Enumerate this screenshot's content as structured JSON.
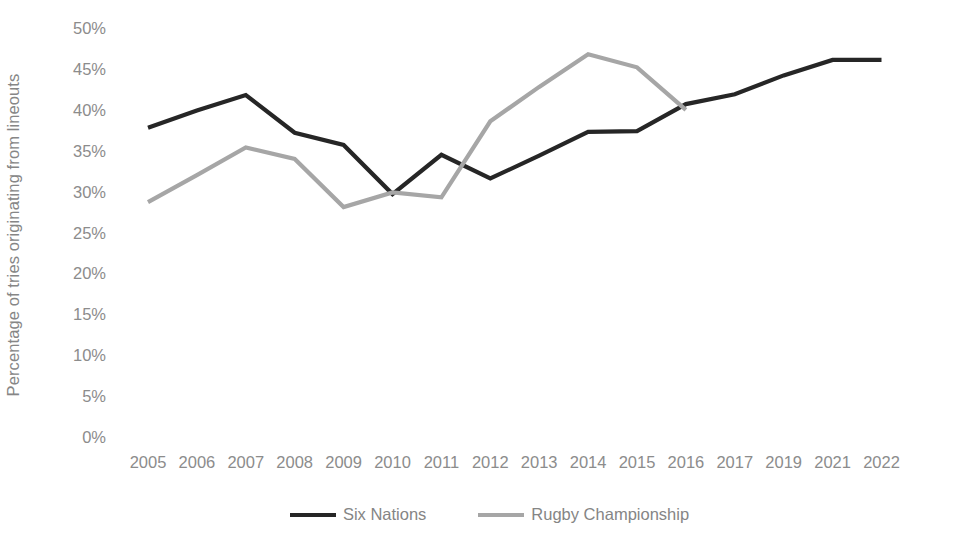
{
  "chart_data": {
    "type": "line",
    "title": "",
    "xlabel": "",
    "ylabel": "Percentage of tries originating from lineouts",
    "x": [
      "2005",
      "2006",
      "2007",
      "2008",
      "2009",
      "2010",
      "2011",
      "2012",
      "2013",
      "2014",
      "2015",
      "2016",
      "2017",
      "2019",
      "2021",
      "2022"
    ],
    "categories": [
      "2005",
      "2006",
      "2007",
      "2008",
      "2009",
      "2010",
      "2011",
      "2012",
      "2013",
      "2014",
      "2015",
      "2016",
      "2017",
      "2019",
      "2021",
      "2022"
    ],
    "ylim": [
      0,
      50
    ],
    "ytick_labels": [
      "0%",
      "5%",
      "10%",
      "15%",
      "20%",
      "25%",
      "30%",
      "35%",
      "40%",
      "45%",
      "50%"
    ],
    "ytick_values": [
      0,
      5,
      10,
      15,
      20,
      25,
      30,
      35,
      40,
      45,
      50
    ],
    "grid": false,
    "legend_position": "bottom",
    "series": [
      {
        "name": "Six Nations",
        "color": "#262626",
        "values": [
          37.8,
          39.9,
          41.8,
          37.2,
          35.7,
          29.7,
          34.5,
          31.6,
          34.4,
          37.3,
          37.4,
          40.7,
          41.9,
          44.2,
          46.1,
          46.1
        ]
      },
      {
        "name": "Rugby Championship",
        "color": "#a6a6a6",
        "values": [
          28.7,
          32.0,
          35.4,
          34.0,
          28.1,
          29.9,
          29.3,
          38.6,
          42.8,
          46.8,
          45.2,
          40.0,
          null,
          null,
          null,
          null
        ]
      }
    ]
  },
  "legend": {
    "items": [
      {
        "label": "Six Nations",
        "color": "#262626"
      },
      {
        "label": "Rugby Championship",
        "color": "#a6a6a6"
      }
    ]
  },
  "axes": {
    "y_title": "Percentage of tries originating from lineouts"
  }
}
